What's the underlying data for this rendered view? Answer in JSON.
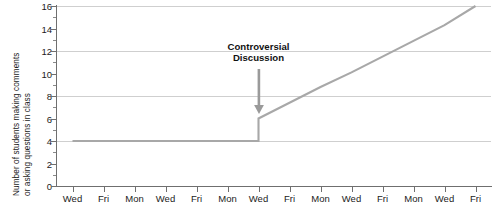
{
  "chart_data": {
    "type": "line",
    "title": "",
    "xlabel": "",
    "ylabel": "Number of students making comments or asking questions in class",
    "ylabel_line1": "Number of students making comments",
    "ylabel_line2": "or asking questions in class",
    "ylim": [
      0,
      16
    ],
    "ytick_values": [
      0,
      2,
      4,
      6,
      8,
      10,
      12,
      14,
      16
    ],
    "ytick_labels": [
      "0",
      "2",
      "4",
      "6",
      "8",
      "10",
      "12",
      "14",
      "16"
    ],
    "yminor_values": [
      1,
      3,
      5,
      7,
      9,
      11,
      13,
      15
    ],
    "gridlines": [
      4,
      8,
      12,
      16
    ],
    "grid": true,
    "legend": "none",
    "categories": [
      "Wed",
      "Fri",
      "Mon",
      "Wed",
      "Fri",
      "Mon",
      "Wed",
      "Fri",
      "Mon",
      "Wed",
      "Fri",
      "Mon",
      "Wed",
      "Fri"
    ],
    "series": [
      {
        "name": "Students participating",
        "color": "#a8a8a8",
        "x": [
          0,
          1,
          2,
          3,
          4,
          5,
          6,
          6,
          7,
          8,
          9,
          10,
          11,
          12,
          13
        ],
        "values": [
          4,
          4,
          4,
          4,
          4,
          4,
          4,
          6,
          7.4,
          8.8,
          10.1,
          11.5,
          12.9,
          14.3,
          16
        ]
      }
    ],
    "annotations": [
      {
        "text_line1": "Controversial",
        "text_line2": "Discussion",
        "x_category_index": 6,
        "y_text": 12.4,
        "arrow": "down-arrow",
        "arrow_color": "#9a9a9a",
        "arrow_from_y": 10.4,
        "arrow_to_y": 6.4
      }
    ],
    "colors": {
      "line": "#a8a8a8",
      "grid": "#cfcfcf",
      "axis": "#6f6f6f",
      "text": "#1b1b1b",
      "annotation_text": "#111111",
      "background": "#ffffff"
    }
  }
}
